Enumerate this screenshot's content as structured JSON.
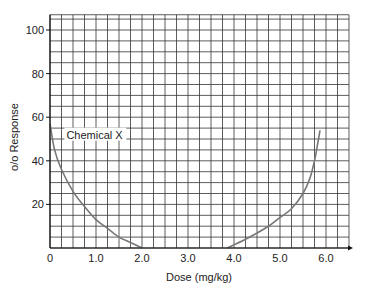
{
  "chart_data": {
    "type": "line",
    "title": "",
    "xlabel": "Dose (mg/kg)",
    "ylabel": "o/o Response",
    "xlim": [
      0,
      6.5
    ],
    "ylim": [
      0,
      107
    ],
    "grid": true,
    "grid_step_x": 0.25,
    "grid_step_y": 5,
    "x_ticks": [
      "0",
      "1.0",
      "2.0",
      "3.0",
      "4.0",
      "5.0",
      "6.0"
    ],
    "x_tick_values": [
      0,
      1,
      2,
      3,
      4,
      5,
      6
    ],
    "y_ticks": [
      "20",
      "40",
      "60",
      "80",
      "100"
    ],
    "y_tick_values": [
      20,
      40,
      60,
      80,
      100
    ],
    "annotations": [
      {
        "text": "Chemical X",
        "x": 0.4,
        "y": 52
      }
    ],
    "series": [
      {
        "name": "Chemical X (left branch)",
        "color": "#777777",
        "points": [
          [
            0.0,
            57
          ],
          [
            0.1,
            45
          ],
          [
            0.25,
            36
          ],
          [
            0.5,
            26
          ],
          [
            0.75,
            19
          ],
          [
            1.0,
            13
          ],
          [
            1.25,
            9
          ],
          [
            1.5,
            5
          ],
          [
            1.75,
            2.5
          ],
          [
            2.0,
            0
          ]
        ]
      },
      {
        "name": "Chemical X (right branch)",
        "color": "#777777",
        "points": [
          [
            3.85,
            0
          ],
          [
            4.25,
            4
          ],
          [
            4.75,
            10
          ],
          [
            5.0,
            14
          ],
          [
            5.25,
            18
          ],
          [
            5.5,
            25
          ],
          [
            5.65,
            32
          ],
          [
            5.75,
            40
          ],
          [
            5.82,
            48
          ],
          [
            5.87,
            54
          ]
        ]
      }
    ]
  },
  "axes": {
    "x_label": "Dose (mg/kg)",
    "y_label": "o/o Response"
  },
  "annotation_label": "Chemical X",
  "colors": {
    "grid": "#333333",
    "curve": "#777777",
    "text": "#222222",
    "background": "#ffffff"
  }
}
